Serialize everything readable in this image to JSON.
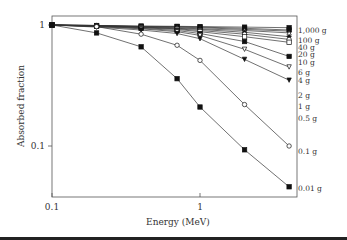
{
  "chart_data": {
    "type": "line",
    "title": "",
    "xlabel": "Energy (MeV)",
    "ylabel": "Absorbed fraction",
    "xscale": "log",
    "yscale": "log",
    "xlim": [
      0.1,
      4
    ],
    "ylim": [
      0.04,
      1.2
    ],
    "x_ticks": [
      {
        "v": 0.1,
        "label": "0.1"
      },
      {
        "v": 1,
        "label": "1"
      }
    ],
    "y_ticks": [
      {
        "v": 1,
        "label": "1"
      },
      {
        "v": 0.1,
        "label": "0.1"
      }
    ],
    "grid": false,
    "x": [
      0.1,
      0.2,
      0.4,
      0.7,
      1.0,
      2.0,
      4.0
    ],
    "series": [
      {
        "name": "1,000 g",
        "marker": "filled-square",
        "values": [
          1,
          0.99,
          0.98,
          0.975,
          0.97,
          0.96,
          0.95
        ]
      },
      {
        "name": "100 g",
        "marker": "filled-square",
        "values": [
          1,
          0.99,
          0.975,
          0.97,
          0.96,
          0.94,
          0.91
        ]
      },
      {
        "name": "40 g",
        "marker": "filled-diamond",
        "values": [
          1,
          0.99,
          0.97,
          0.96,
          0.95,
          0.92,
          0.89
        ]
      },
      {
        "name": "20 g",
        "marker": "open-triangle",
        "values": [
          1,
          0.99,
          0.965,
          0.95,
          0.93,
          0.9,
          0.86
        ]
      },
      {
        "name": "10 g",
        "marker": "filled-diamond",
        "values": [
          1,
          0.985,
          0.96,
          0.94,
          0.92,
          0.87,
          0.8
        ]
      },
      {
        "name": "6 g",
        "marker": "open-circle",
        "values": [
          1,
          0.98,
          0.955,
          0.93,
          0.9,
          0.84,
          0.76
        ]
      },
      {
        "name": "4 g",
        "marker": "open-square",
        "values": [
          1,
          0.98,
          0.95,
          0.92,
          0.88,
          0.8,
          0.72
        ]
      },
      {
        "name": "2 g",
        "marker": "filled-square",
        "values": [
          1,
          0.975,
          0.94,
          0.9,
          0.85,
          0.73,
          0.55
        ]
      },
      {
        "name": "1 g",
        "marker": "open-triangle-down",
        "values": [
          1,
          0.97,
          0.93,
          0.88,
          0.82,
          0.63,
          0.45
        ]
      },
      {
        "name": "0.5 g",
        "marker": "filled-triangle-down",
        "values": [
          1,
          0.96,
          0.91,
          0.85,
          0.77,
          0.52,
          0.35
        ]
      },
      {
        "name": "0.1 g",
        "marker": "open-circle",
        "values": [
          1,
          0.97,
          0.84,
          0.68,
          0.51,
          0.22,
          0.1
        ]
      },
      {
        "name": "0.01 g",
        "marker": "filled-square",
        "values": [
          1,
          0.86,
          0.66,
          0.36,
          0.21,
          0.093,
          0.046
        ]
      }
    ],
    "legend_position": "right-inline-labels"
  },
  "labels": {
    "series_labels": [
      "1,000 g",
      "100 g",
      "40 g",
      "20 g",
      "10 g",
      "6 g",
      "4 g",
      "2 g",
      "1 g",
      "0.5 g",
      "0.1 g",
      "0.01 g"
    ]
  }
}
